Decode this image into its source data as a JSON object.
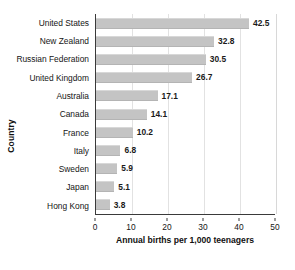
{
  "chart_data": {
    "type": "bar",
    "orientation": "horizontal",
    "title": "",
    "xlabel": "Annual births per 1,000 teenagers",
    "ylabel": "Country",
    "categories": [
      "United States",
      "New Zealand",
      "Russian Federation",
      "United Kingdom",
      "Australia",
      "Canada",
      "France",
      "Italy",
      "Sweden",
      "Japan",
      "Hong Kong"
    ],
    "values": [
      42.5,
      32.8,
      30.5,
      26.7,
      17.1,
      14.1,
      10.2,
      6.8,
      5.9,
      5.1,
      3.8
    ],
    "value_labels": [
      "42.5",
      "32.8",
      "30.5",
      "26.7",
      "17.1",
      "14.1",
      "10.2",
      "6.8",
      "5.9",
      "5.1",
      "3.8"
    ],
    "xlim": [
      0,
      50
    ],
    "xticks": [
      0,
      10,
      20,
      30,
      40,
      50
    ],
    "xtick_labels": [
      "0",
      "10",
      "20",
      "30",
      "40",
      "50"
    ],
    "grid": "vertical",
    "legend": "none",
    "bar_color": "#c4c4c4",
    "axis_color": "#3a3a3a",
    "gridline_color": "#e2e2e2",
    "text_color": "#141414",
    "background": "#ffffff"
  }
}
